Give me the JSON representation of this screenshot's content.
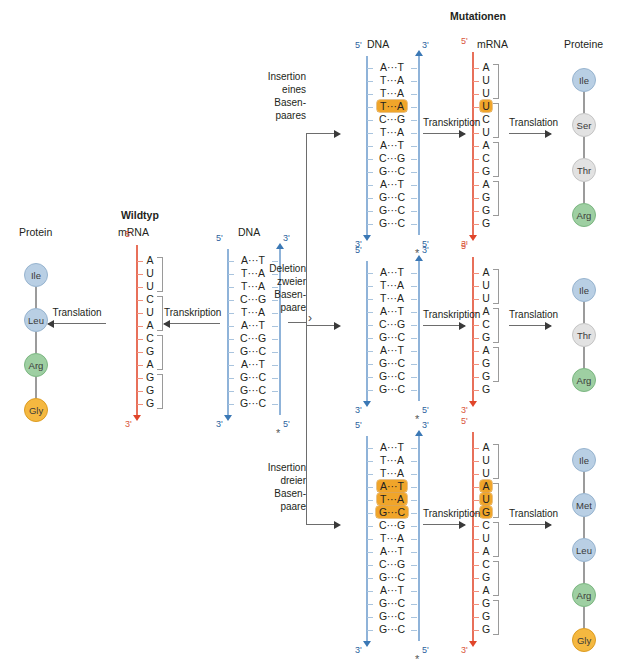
{
  "figure": {
    "wildtype_title": "Wildtyp",
    "mutations_title": "Mutationen",
    "process_transcription": "Transkription",
    "process_translation": "Translation"
  },
  "headers": {
    "protein": "Protein",
    "mrna": "mRNA",
    "dna": "DNA",
    "dna_mut": "DNA",
    "mrna_mut": "mRNA",
    "proteine": "Proteine"
  },
  "ends": {
    "five": "5'",
    "three": "3'",
    "star": "*"
  },
  "wildtype": {
    "dna": [
      {
        "l": "A",
        "r": "T"
      },
      {
        "l": "T",
        "r": "A"
      },
      {
        "l": "T",
        "r": "A"
      },
      {
        "l": "C",
        "r": "G"
      },
      {
        "l": "T",
        "r": "A"
      },
      {
        "l": "A",
        "r": "T"
      },
      {
        "l": "C",
        "r": "G"
      },
      {
        "l": "G",
        "r": "C"
      },
      {
        "l": "A",
        "r": "T"
      },
      {
        "l": "G",
        "r": "C"
      },
      {
        "l": "G",
        "r": "C"
      },
      {
        "l": "G",
        "r": "C"
      }
    ],
    "mrna": [
      "A",
      "U",
      "U",
      "C",
      "U",
      "A",
      "C",
      "G",
      "A",
      "G",
      "G",
      "G"
    ],
    "codons": [
      "AUU",
      "CUA",
      "CGA",
      "GGG"
    ],
    "protein": [
      {
        "name": "Ile",
        "color": "blue"
      },
      {
        "name": "Leu",
        "color": "blue"
      },
      {
        "name": "Arg",
        "color": "green"
      },
      {
        "name": "Gly",
        "color": "orange"
      }
    ]
  },
  "mutations": [
    {
      "label_lines": [
        "Insertion",
        "eines",
        "Basen-",
        "paares"
      ],
      "dna": [
        {
          "l": "A",
          "r": "T",
          "hl": false
        },
        {
          "l": "T",
          "r": "A",
          "hl": false
        },
        {
          "l": "T",
          "r": "A",
          "hl": false
        },
        {
          "l": "T",
          "r": "A",
          "hl": true
        },
        {
          "l": "C",
          "r": "G",
          "hl": false
        },
        {
          "l": "T",
          "r": "A",
          "hl": false
        },
        {
          "l": "A",
          "r": "T",
          "hl": false
        },
        {
          "l": "C",
          "r": "G",
          "hl": false
        },
        {
          "l": "G",
          "r": "C",
          "hl": false
        },
        {
          "l": "A",
          "r": "T",
          "hl": false
        },
        {
          "l": "G",
          "r": "C",
          "hl": false
        },
        {
          "l": "G",
          "r": "C",
          "hl": false
        },
        {
          "l": "G",
          "r": "C",
          "hl": false
        }
      ],
      "mrna": [
        {
          "b": "A",
          "hl": false
        },
        {
          "b": "U",
          "hl": false
        },
        {
          "b": "U",
          "hl": false
        },
        {
          "b": "U",
          "hl": true
        },
        {
          "b": "C",
          "hl": false
        },
        {
          "b": "U",
          "hl": false
        },
        {
          "b": "A",
          "hl": false
        },
        {
          "b": "C",
          "hl": false
        },
        {
          "b": "G",
          "hl": false
        },
        {
          "b": "A",
          "hl": false
        },
        {
          "b": "G",
          "hl": false
        },
        {
          "b": "G",
          "hl": false
        },
        {
          "b": "G",
          "hl": false
        }
      ],
      "codons": [
        "AUU",
        "UCU",
        "ACG",
        "AGG"
      ],
      "protein": [
        {
          "name": "Ile",
          "color": "blue"
        },
        {
          "name": "Ser",
          "color": "gray"
        },
        {
          "name": "Thr",
          "color": "gray"
        },
        {
          "name": "Arg",
          "color": "green"
        }
      ]
    },
    {
      "label_lines": [
        "Deletion",
        "zweier",
        "Basen-",
        "paare"
      ],
      "dna": [
        {
          "l": "A",
          "r": "T",
          "hl": false
        },
        {
          "l": "T",
          "r": "A",
          "hl": false
        },
        {
          "l": "T",
          "r": "A",
          "hl": false
        },
        {
          "l": "A",
          "r": "T",
          "hl": false
        },
        {
          "l": "C",
          "r": "G",
          "hl": false
        },
        {
          "l": "G",
          "r": "C",
          "hl": false
        },
        {
          "l": "A",
          "r": "T",
          "hl": false
        },
        {
          "l": "G",
          "r": "C",
          "hl": false
        },
        {
          "l": "G",
          "r": "C",
          "hl": false
        },
        {
          "l": "G",
          "r": "C",
          "hl": false
        }
      ],
      "mrna": [
        {
          "b": "A",
          "hl": false
        },
        {
          "b": "U",
          "hl": false
        },
        {
          "b": "U",
          "hl": false
        },
        {
          "b": "A",
          "hl": false
        },
        {
          "b": "C",
          "hl": false
        },
        {
          "b": "G",
          "hl": false
        },
        {
          "b": "A",
          "hl": false
        },
        {
          "b": "G",
          "hl": false
        },
        {
          "b": "G",
          "hl": false
        },
        {
          "b": "G",
          "hl": false
        }
      ],
      "codons": [
        "AUU",
        "ACG",
        "AGG"
      ],
      "protein": [
        {
          "name": "Ile",
          "color": "blue"
        },
        {
          "name": "Thr",
          "color": "gray"
        },
        {
          "name": "Arg",
          "color": "green"
        }
      ]
    },
    {
      "label_lines": [
        "Insertion",
        "dreier",
        "Basen-",
        "paare"
      ],
      "dna": [
        {
          "l": "A",
          "r": "T",
          "hl": false
        },
        {
          "l": "T",
          "r": "A",
          "hl": false
        },
        {
          "l": "T",
          "r": "A",
          "hl": false
        },
        {
          "l": "A",
          "r": "T",
          "hl": true
        },
        {
          "l": "T",
          "r": "A",
          "hl": true
        },
        {
          "l": "G",
          "r": "C",
          "hl": true
        },
        {
          "l": "C",
          "r": "G",
          "hl": false
        },
        {
          "l": "T",
          "r": "A",
          "hl": false
        },
        {
          "l": "A",
          "r": "T",
          "hl": false
        },
        {
          "l": "C",
          "r": "G",
          "hl": false
        },
        {
          "l": "G",
          "r": "C",
          "hl": false
        },
        {
          "l": "A",
          "r": "T",
          "hl": false
        },
        {
          "l": "G",
          "r": "C",
          "hl": false
        },
        {
          "l": "G",
          "r": "C",
          "hl": false
        },
        {
          "l": "G",
          "r": "C",
          "hl": false
        }
      ],
      "mrna": [
        {
          "b": "A",
          "hl": false
        },
        {
          "b": "U",
          "hl": false
        },
        {
          "b": "U",
          "hl": false
        },
        {
          "b": "A",
          "hl": true
        },
        {
          "b": "U",
          "hl": true
        },
        {
          "b": "G",
          "hl": true
        },
        {
          "b": "C",
          "hl": false
        },
        {
          "b": "U",
          "hl": false
        },
        {
          "b": "A",
          "hl": false
        },
        {
          "b": "C",
          "hl": false
        },
        {
          "b": "G",
          "hl": false
        },
        {
          "b": "A",
          "hl": false
        },
        {
          "b": "G",
          "hl": false
        },
        {
          "b": "G",
          "hl": false
        },
        {
          "b": "G",
          "hl": false
        }
      ],
      "codons": [
        "AUU",
        "AUG",
        "CUA",
        "CGA",
        "GGG"
      ],
      "protein": [
        {
          "name": "Ile",
          "color": "blue"
        },
        {
          "name": "Met",
          "color": "blue"
        },
        {
          "name": "Leu",
          "color": "blue"
        },
        {
          "name": "Arg",
          "color": "green"
        },
        {
          "name": "Gly",
          "color": "orange"
        }
      ]
    }
  ],
  "colors": {
    "highlight": "#f0a52a",
    "dna_strand": "#8fb3d9",
    "mrna_strand": "#e8705a",
    "aa_blue": "#b9cfe4",
    "aa_gray": "#e2e2e2",
    "aa_green": "#9ecfa2",
    "aa_orange": "#f5b840"
  }
}
